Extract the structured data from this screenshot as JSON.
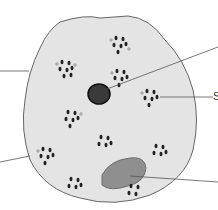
{
  "diagram": {
    "type": "cell-illustration",
    "labels": [
      {
        "id": "label-right-middle",
        "text": "S",
        "x": 213,
        "y": 90
      }
    ],
    "colors": {
      "cytoplasm": "#e4e4e4",
      "outline": "#666666",
      "nucleus": "#333333",
      "body": "#8f8f8f",
      "leader": "#555555"
    }
  }
}
